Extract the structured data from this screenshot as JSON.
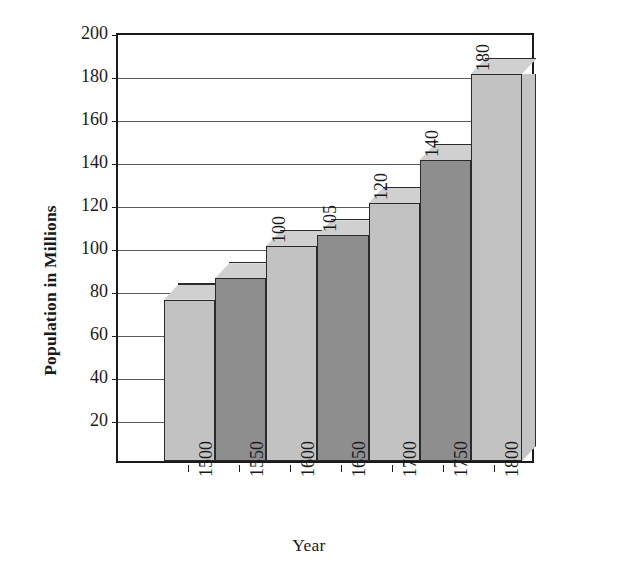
{
  "chart_data": {
    "type": "bar",
    "title": "",
    "xlabel": "Year",
    "ylabel": "Population in Millions",
    "categories": [
      "1500",
      "1550",
      "1600",
      "1650",
      "1700",
      "1750",
      "1800"
    ],
    "values": [
      75,
      85,
      100,
      105,
      120,
      140,
      180
    ],
    "data_labels": [
      "",
      "",
      "100",
      "105",
      "120",
      "140",
      "180"
    ],
    "ylim": [
      0,
      200
    ],
    "ytick_labels": [
      "200",
      "180",
      "160",
      "140",
      "120",
      "100",
      "80",
      "60",
      "40",
      "20"
    ],
    "ytick_values": [
      200,
      180,
      160,
      140,
      120,
      100,
      80,
      60,
      40,
      20
    ],
    "ytick_step": 20,
    "grid": true,
    "legend": "none",
    "style": "3d-column",
    "bar_colors": [
      "#c2c2c2",
      "#8e8e8e",
      "#c2c2c2",
      "#8e8e8e",
      "#c2c2c2",
      "#8e8e8e",
      "#c2c2c2"
    ],
    "bar_top_color": "#d0d0d0",
    "bar_side_color": "#c4c4c4",
    "frame_color": "#1a1a1a",
    "grid_color": "#5a5a5a",
    "background": "#ffffff"
  }
}
